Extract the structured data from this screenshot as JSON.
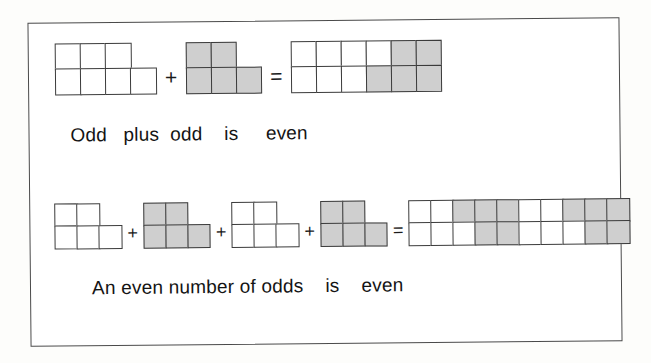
{
  "figure": {
    "kind": "square-block-parity-diagram",
    "frame_color": "#4a4a4a",
    "page_background": "#fdfdfb",
    "colors": {
      "odd_block_white": "#ffffff",
      "odd_block_gray": "#cfcfcf",
      "outline": "#3b3b3b",
      "text": "#141414"
    }
  },
  "rows": [
    {
      "id": "row-1",
      "caption_words": [
        "Odd",
        "plus",
        "odd",
        "is",
        "even"
      ],
      "caption_text": "Odd   plus  odd    is     even",
      "operators": [
        "+",
        "="
      ],
      "terms": [
        {
          "name": "odd-shape-white-7",
          "fill": "white",
          "count": 7,
          "top_row": 3,
          "bottom_row": 4,
          "parity": "odd"
        },
        {
          "name": "odd-shape-gray-5",
          "fill": "gray",
          "count": 5,
          "top_row": 2,
          "bottom_row": 3,
          "parity": "odd"
        }
      ],
      "result": {
        "name": "even-rectangle-12",
        "count": 12,
        "columns": 6,
        "rows": 2,
        "parity": "even",
        "top_row_fills": [
          "white",
          "white",
          "white",
          "white",
          "gray",
          "gray"
        ],
        "bottom_row_fills": [
          "white",
          "white",
          "white",
          "gray",
          "gray",
          "gray"
        ]
      }
    },
    {
      "id": "row-2",
      "caption_words": [
        "An even number of odds",
        "is",
        "even"
      ],
      "caption_text": "An even number of odds    is    even",
      "operators": [
        "+",
        "+",
        "+",
        "="
      ],
      "terms": [
        {
          "name": "odd-shape-white-5-a",
          "fill": "white",
          "count": 5,
          "top_row": 2,
          "bottom_row": 3,
          "parity": "odd"
        },
        {
          "name": "odd-shape-gray-5-a",
          "fill": "gray",
          "count": 5,
          "top_row": 2,
          "bottom_row": 3,
          "parity": "odd"
        },
        {
          "name": "odd-shape-white-5-b",
          "fill": "white",
          "count": 5,
          "top_row": 2,
          "bottom_row": 3,
          "parity": "odd"
        },
        {
          "name": "odd-shape-gray-5-b",
          "fill": "gray",
          "count": 5,
          "top_row": 2,
          "bottom_row": 3,
          "parity": "odd"
        }
      ],
      "result": {
        "name": "even-rectangle-20",
        "count": 20,
        "columns": 10,
        "rows": 2,
        "parity": "even",
        "top_row_fills": [
          "white",
          "white",
          "gray",
          "gray",
          "gray",
          "white",
          "white",
          "gray",
          "gray",
          "gray"
        ],
        "bottom_row_fills": [
          "white",
          "white",
          "white",
          "gray",
          "gray",
          "white",
          "white",
          "white",
          "gray",
          "gray"
        ]
      }
    }
  ]
}
